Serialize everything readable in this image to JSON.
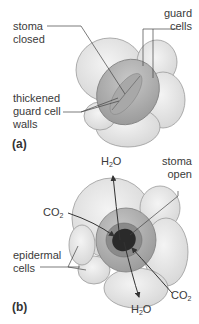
{
  "panels": [
    {
      "id": "a",
      "label": "(a)",
      "labels": {
        "stoma_closed": [
          "stoma",
          "closed"
        ],
        "guard_cells": [
          "guard",
          "cells"
        ],
        "thickened_walls": [
          "thickened",
          "guard cell",
          "walls"
        ]
      }
    },
    {
      "id": "b",
      "label": "(b)",
      "labels": {
        "stoma_open": [
          "stoma",
          "open"
        ],
        "epidermal_cells": [
          "epidermal",
          "cells"
        ],
        "h2o_top": {
          "base": "H",
          "sub": "2",
          "tail": "O"
        },
        "h2o_bottom": {
          "base": "H",
          "sub": "2",
          "tail": "O"
        },
        "co2_left": {
          "base": "CO",
          "sub": "2"
        },
        "co2_right": {
          "base": "CO",
          "sub": "2"
        }
      }
    }
  ],
  "colors": {
    "epidermal": "#e6e6e6",
    "epidermal_edge": "#9a9a9a",
    "guard": "#b8b8b8",
    "guard_dark": "#8f8f8f",
    "pore": "#2a2a2a",
    "line": "#444444"
  }
}
